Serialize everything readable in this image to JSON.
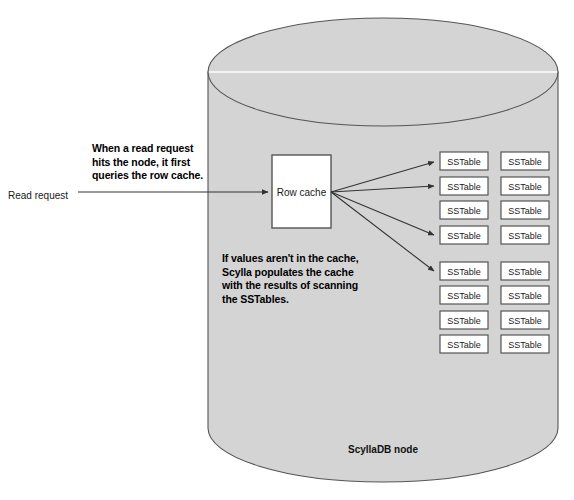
{
  "diagram": {
    "type": "architecture-diagram",
    "background_color": "#ffffff",
    "node": {
      "label": "ScyllaDB node",
      "shape": "cylinder",
      "fill_color": "#d4d4d4",
      "stroke_color": "#555555",
      "highlight_color": "#ffffff",
      "bounds": {
        "x": 208,
        "y": 18,
        "width": 350,
        "height": 464
      },
      "ellipse_ry": 54
    },
    "entry": {
      "label": "Read request",
      "arrow_from_x": 78,
      "arrow_to_x": 272,
      "arrow_y": 192
    },
    "callouts": [
      {
        "name": "read-request-callout",
        "text": "When a read request\nhits the node, it first\nqueries the row cache."
      },
      {
        "name": "cache-populate-callout",
        "text": "If values aren't in the cache,\nScylla populates the cache\nwith the results of scanning\nthe SSTables."
      }
    ],
    "row_cache": {
      "label": "Row cache",
      "fill_color": "#ffffff",
      "stroke_color": "#555555",
      "x": 272,
      "y": 155,
      "width": 59,
      "height": 73
    },
    "sstables": {
      "label": "SSTable",
      "fill_color": "#ffffff",
      "stroke_color": "#555555",
      "box_width": 48,
      "box_height": 18,
      "columns_x": [
        440,
        501
      ],
      "rows_y": [
        152,
        177,
        201,
        226,
        262,
        286,
        311,
        335
      ],
      "count_per_column": 8,
      "total_count": 16
    },
    "arrows": {
      "color": "#333333",
      "origin": {
        "x": 331,
        "y": 192
      },
      "targets_row_index": [
        0,
        1,
        3,
        4
      ],
      "target_x": 440
    }
  }
}
